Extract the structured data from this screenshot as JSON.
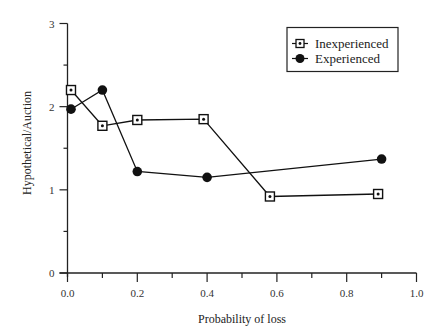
{
  "chart_data": {
    "type": "line",
    "title": "",
    "xlabel": "Probability of loss",
    "ylabel": "Hypothetical/Auction",
    "xlim": [
      0.0,
      1.0
    ],
    "ylim": [
      0,
      3
    ],
    "x_ticks": [
      "0.0",
      "0.2",
      "0.4",
      "0.6",
      "0.8",
      "1.0"
    ],
    "x_tick_values": [
      0.0,
      0.2,
      0.4,
      0.6,
      0.8,
      1.0
    ],
    "x_minor_tick_values": [
      0.1,
      0.3,
      0.5,
      0.7,
      0.9
    ],
    "y_ticks": [
      "0",
      "1",
      "2",
      "3"
    ],
    "y_tick_values": [
      0,
      1,
      2,
      3
    ],
    "y_minor_tick_values": [
      0.5,
      1.5,
      2.5
    ],
    "grid": false,
    "legend_position": "upper right",
    "series": [
      {
        "name": "Inexperienced",
        "marker": "square-dot",
        "x": [
          0.01,
          0.1,
          0.2,
          0.39,
          0.58,
          0.89
        ],
        "y": [
          2.2,
          1.77,
          1.84,
          1.85,
          0.92,
          0.95
        ]
      },
      {
        "name": "Experienced",
        "marker": "filled-circle",
        "x": [
          0.01,
          0.1,
          0.2,
          0.4,
          0.9
        ],
        "y": [
          1.97,
          2.2,
          1.22,
          1.15,
          1.37
        ]
      }
    ]
  },
  "legend": {
    "items": [
      {
        "label": "Inexperienced"
      },
      {
        "label": "Experienced"
      }
    ]
  },
  "colors": {
    "line": "#111111",
    "axis": "#222222",
    "background": "#ffffff"
  }
}
